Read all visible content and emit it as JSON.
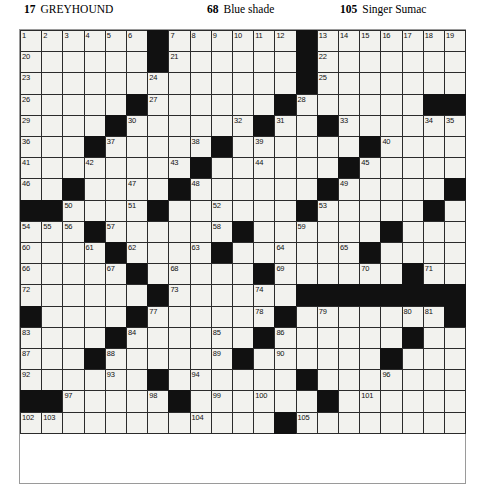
{
  "header": {
    "clues": [
      {
        "number": "17",
        "text": "GREYHOUND"
      },
      {
        "number": "68",
        "text": "Blue shade"
      },
      {
        "number": "105",
        "text": "Singer Sumac"
      }
    ]
  },
  "grid": {
    "columns": 21,
    "rows": 19,
    "cell_size": 21.2,
    "colors": {
      "block": "#111111",
      "cell": "#f2f2ee",
      "border": "#2b2b2b"
    },
    "blocks": [
      [
        0,
        6
      ],
      [
        0,
        13
      ],
      [
        1,
        6
      ],
      [
        1,
        13
      ],
      [
        2,
        13
      ],
      [
        3,
        5
      ],
      [
        3,
        12
      ],
      [
        3,
        19
      ],
      [
        3,
        20
      ],
      [
        4,
        4
      ],
      [
        4,
        11
      ],
      [
        4,
        14
      ],
      [
        5,
        3
      ],
      [
        5,
        9
      ],
      [
        5,
        16
      ],
      [
        6,
        8
      ],
      [
        6,
        15
      ],
      [
        7,
        2
      ],
      [
        7,
        7
      ],
      [
        7,
        14
      ],
      [
        7,
        20
      ],
      [
        8,
        0
      ],
      [
        8,
        1
      ],
      [
        8,
        6
      ],
      [
        8,
        13
      ],
      [
        8,
        19
      ],
      [
        9,
        3
      ],
      [
        9,
        10
      ],
      [
        9,
        17
      ],
      [
        10,
        4
      ],
      [
        10,
        9
      ],
      [
        10,
        16
      ],
      [
        11,
        5
      ],
      [
        11,
        11
      ],
      [
        11,
        18
      ],
      [
        12,
        6
      ],
      [
        12,
        13
      ],
      [
        12,
        14
      ],
      [
        12,
        15
      ],
      [
        12,
        16
      ],
      [
        12,
        17
      ],
      [
        12,
        18
      ],
      [
        12,
        19
      ],
      [
        12,
        20
      ],
      [
        13,
        0
      ],
      [
        13,
        5
      ],
      [
        13,
        12
      ],
      [
        13,
        20
      ],
      [
        14,
        4
      ],
      [
        14,
        11
      ],
      [
        14,
        18
      ],
      [
        15,
        3
      ],
      [
        15,
        10
      ],
      [
        15,
        17
      ],
      [
        16,
        6
      ],
      [
        16,
        13
      ],
      [
        17,
        0
      ],
      [
        17,
        1
      ],
      [
        17,
        7
      ],
      [
        17,
        14
      ],
      [
        18,
        12
      ],
      [
        19,
        12
      ],
      [
        20,
        12
      ]
    ],
    "numbers": [
      {
        "r": 0,
        "c": 0,
        "n": "1"
      },
      {
        "r": 0,
        "c": 1,
        "n": "2"
      },
      {
        "r": 0,
        "c": 2,
        "n": "3"
      },
      {
        "r": 0,
        "c": 3,
        "n": "4"
      },
      {
        "r": 0,
        "c": 4,
        "n": "5"
      },
      {
        "r": 0,
        "c": 5,
        "n": "6"
      },
      {
        "r": 0,
        "c": 7,
        "n": "7"
      },
      {
        "r": 0,
        "c": 8,
        "n": "8"
      },
      {
        "r": 0,
        "c": 9,
        "n": "9"
      },
      {
        "r": 0,
        "c": 10,
        "n": "10"
      },
      {
        "r": 0,
        "c": 11,
        "n": "11"
      },
      {
        "r": 0,
        "c": 12,
        "n": "12"
      },
      {
        "r": 0,
        "c": 14,
        "n": "13"
      },
      {
        "r": 0,
        "c": 15,
        "n": "14"
      },
      {
        "r": 0,
        "c": 16,
        "n": "15"
      },
      {
        "r": 0,
        "c": 17,
        "n": "16"
      },
      {
        "r": 0,
        "c": 18,
        "n": "17"
      },
      {
        "r": 0,
        "c": 19,
        "n": "18"
      },
      {
        "r": 0,
        "c": 20,
        "n": "19"
      },
      {
        "r": 1,
        "c": 0,
        "n": "20"
      },
      {
        "r": 1,
        "c": 7,
        "n": "21"
      },
      {
        "r": 1,
        "c": 14,
        "n": "22"
      },
      {
        "r": 2,
        "c": 0,
        "n": "23"
      },
      {
        "r": 2,
        "c": 6,
        "n": "24"
      },
      {
        "r": 2,
        "c": 14,
        "n": "25"
      },
      {
        "r": 3,
        "c": 0,
        "n": "26"
      },
      {
        "r": 3,
        "c": 6,
        "n": "27"
      },
      {
        "r": 3,
        "c": 13,
        "n": "28"
      },
      {
        "r": 4,
        "c": 0,
        "n": "29"
      },
      {
        "r": 4,
        "c": 5,
        "n": "30"
      },
      {
        "r": 4,
        "c": 12,
        "n": "31"
      },
      {
        "r": 4,
        "c": 10,
        "n": "32"
      },
      {
        "r": 4,
        "c": 15,
        "n": "33"
      },
      {
        "r": 4,
        "c": 19,
        "n": "34"
      },
      {
        "r": 4,
        "c": 20,
        "n": "35"
      },
      {
        "r": 5,
        "c": 0,
        "n": "36"
      },
      {
        "r": 5,
        "c": 4,
        "n": "37"
      },
      {
        "r": 5,
        "c": 8,
        "n": "38"
      },
      {
        "r": 5,
        "c": 11,
        "n": "39"
      },
      {
        "r": 5,
        "c": 17,
        "n": "40"
      },
      {
        "r": 6,
        "c": 0,
        "n": "41"
      },
      {
        "r": 6,
        "c": 3,
        "n": "42"
      },
      {
        "r": 6,
        "c": 7,
        "n": "43"
      },
      {
        "r": 6,
        "c": 11,
        "n": "44"
      },
      {
        "r": 6,
        "c": 16,
        "n": "45"
      },
      {
        "r": 7,
        "c": 0,
        "n": "46"
      },
      {
        "r": 7,
        "c": 5,
        "n": "47"
      },
      {
        "r": 7,
        "c": 8,
        "n": "48"
      },
      {
        "r": 7,
        "c": 15,
        "n": "49"
      },
      {
        "r": 8,
        "c": 2,
        "n": "50"
      },
      {
        "r": 8,
        "c": 5,
        "n": "51"
      },
      {
        "r": 8,
        "c": 9,
        "n": "52"
      },
      {
        "r": 8,
        "c": 14,
        "n": "53"
      },
      {
        "r": 9,
        "c": 0,
        "n": "54"
      },
      {
        "r": 9,
        "c": 1,
        "n": "55"
      },
      {
        "r": 9,
        "c": 2,
        "n": "56"
      },
      {
        "r": 9,
        "c": 4,
        "n": "57"
      },
      {
        "r": 9,
        "c": 9,
        "n": "58"
      },
      {
        "r": 9,
        "c": 13,
        "n": "59"
      },
      {
        "r": 10,
        "c": 0,
        "n": "60"
      },
      {
        "r": 10,
        "c": 3,
        "n": "61"
      },
      {
        "r": 10,
        "c": 5,
        "n": "62"
      },
      {
        "r": 10,
        "c": 8,
        "n": "63"
      },
      {
        "r": 10,
        "c": 12,
        "n": "64"
      },
      {
        "r": 10,
        "c": 15,
        "n": "65"
      },
      {
        "r": 11,
        "c": 0,
        "n": "66"
      },
      {
        "r": 11,
        "c": 4,
        "n": "67"
      },
      {
        "r": 11,
        "c": 7,
        "n": "68"
      },
      {
        "r": 11,
        "c": 12,
        "n": "69"
      },
      {
        "r": 11,
        "c": 16,
        "n": "70"
      },
      {
        "r": 11,
        "c": 19,
        "n": "71"
      },
      {
        "r": 12,
        "c": 0,
        "n": "72"
      },
      {
        "r": 12,
        "c": 7,
        "n": "73"
      },
      {
        "r": 12,
        "c": 11,
        "n": "74"
      },
      {
        "r": 12,
        "c": 18,
        "n": "75"
      },
      {
        "r": 13,
        "c": 0,
        "n": "76"
      },
      {
        "r": 13,
        "c": 6,
        "n": "77"
      },
      {
        "r": 13,
        "c": 11,
        "n": "78"
      },
      {
        "r": 13,
        "c": 14,
        "n": "79"
      },
      {
        "r": 13,
        "c": 18,
        "n": "80"
      },
      {
        "r": 13,
        "c": 19,
        "n": "81"
      },
      {
        "r": 13,
        "c": 20,
        "n": "82"
      },
      {
        "r": 14,
        "c": 0,
        "n": "83"
      },
      {
        "r": 14,
        "c": 5,
        "n": "84"
      },
      {
        "r": 14,
        "c": 9,
        "n": "85"
      },
      {
        "r": 14,
        "c": 12,
        "n": "86"
      },
      {
        "r": 15,
        "c": 0,
        "n": "87"
      },
      {
        "r": 15,
        "c": 4,
        "n": "88"
      },
      {
        "r": 15,
        "c": 9,
        "n": "89"
      },
      {
        "r": 15,
        "c": 12,
        "n": "90"
      },
      {
        "r": 15,
        "c": 17,
        "n": "91"
      },
      {
        "r": 16,
        "c": 0,
        "n": "92"
      },
      {
        "r": 16,
        "c": 4,
        "n": "93"
      },
      {
        "r": 16,
        "c": 8,
        "n": "94"
      },
      {
        "r": 16,
        "c": 13,
        "n": "95"
      },
      {
        "r": 16,
        "c": 17,
        "n": "96"
      },
      {
        "r": 17,
        "c": 2,
        "n": "97"
      },
      {
        "r": 17,
        "c": 6,
        "n": "98"
      },
      {
        "r": 17,
        "c": 9,
        "n": "99"
      },
      {
        "r": 17,
        "c": 11,
        "n": "100"
      },
      {
        "r": 17,
        "c": 16,
        "n": "101"
      },
      {
        "r": 18,
        "c": 0,
        "n": "102"
      },
      {
        "r": 18,
        "c": 1,
        "n": "103"
      },
      {
        "r": 18,
        "c": 8,
        "n": "104"
      },
      {
        "r": 18,
        "c": 13,
        "n": "105"
      },
      {
        "r": 19,
        "c": 0,
        "n": "106"
      },
      {
        "r": 19,
        "c": 8,
        "n": "107"
      },
      {
        "r": 19,
        "c": 13,
        "n": "108"
      },
      {
        "r": 20,
        "c": 0,
        "n": "109"
      },
      {
        "r": 20,
        "c": 8,
        "n": "110"
      },
      {
        "r": 20,
        "c": 13,
        "n": "111"
      }
    ]
  }
}
